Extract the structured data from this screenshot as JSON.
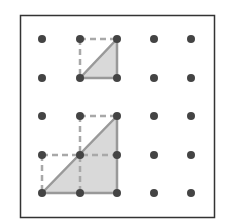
{
  "diagram": {
    "type": "geoboard",
    "grid": {
      "cols": 5,
      "rows": 5
    },
    "colors": {
      "border": "#333333",
      "dot": "#444444",
      "fill": "#d9d9d9",
      "solid_line": "#999999",
      "dashed_line": "#a8a8a8"
    },
    "shapes": [
      {
        "name": "small-triangle",
        "vertices": [
          [
            1,
            1
          ],
          [
            2,
            1
          ],
          [
            2,
            0
          ]
        ],
        "dashed": [
          [
            [
              1,
              0
            ],
            [
              2,
              0
            ]
          ],
          [
            [
              1,
              0
            ],
            [
              1,
              1
            ]
          ]
        ]
      },
      {
        "name": "large-triangle",
        "vertices": [
          [
            0,
            4
          ],
          [
            2,
            4
          ],
          [
            2,
            2
          ]
        ],
        "dashed": [
          [
            [
              1,
              2
            ],
            [
              2,
              2
            ]
          ],
          [
            [
              1,
              2
            ],
            [
              1,
              4
            ]
          ],
          [
            [
              0,
              3
            ],
            [
              2,
              3
            ]
          ],
          [
            [
              0,
              3
            ],
            [
              0,
              4
            ]
          ]
        ]
      }
    ]
  }
}
